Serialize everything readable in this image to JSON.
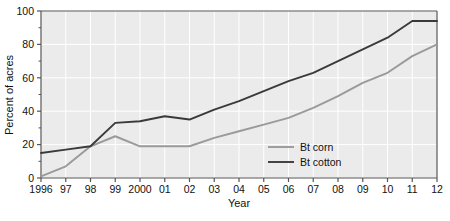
{
  "chart_data": {
    "type": "line",
    "title": "",
    "xlabel": "Year",
    "ylabel": "Percent of acres",
    "x": [
      1996,
      1997,
      1998,
      1999,
      2000,
      2001,
      2002,
      2003,
      2004,
      2005,
      2006,
      2007,
      2008,
      2009,
      2010,
      2011,
      2012
    ],
    "xtick_labels": [
      "1996",
      "97",
      "98",
      "99",
      "2000",
      "01",
      "02",
      "03",
      "04",
      "05",
      "06",
      "07",
      "08",
      "09",
      "10",
      "11",
      "12"
    ],
    "ytick_labels": [
      "0",
      "20",
      "40",
      "60",
      "80",
      "100"
    ],
    "yticks": [
      0,
      20,
      40,
      60,
      80,
      100
    ],
    "ylim": [
      0,
      100
    ],
    "xlim": [
      1996,
      2012
    ],
    "grid": true,
    "legend_position": "inside-lower-right",
    "series": [
      {
        "name": "Bt corn",
        "color": "#9a9a9a",
        "values": [
          1,
          7,
          19,
          25,
          19,
          19,
          19,
          24,
          28,
          32,
          36,
          42,
          49,
          57,
          63,
          73,
          80
        ]
      },
      {
        "name": "Bt cotton",
        "color": "#3a3a3a",
        "values": [
          15,
          17,
          19,
          33,
          34,
          37,
          35,
          41,
          46,
          52,
          58,
          63,
          70,
          77,
          84,
          94,
          94
        ]
      }
    ]
  },
  "axes": {
    "y_label": "Percent of acres",
    "x_label": "Year"
  },
  "legend": {
    "items": [
      {
        "label": "Bt corn",
        "color": "#9a9a9a"
      },
      {
        "label": "Bt cotton",
        "color": "#3a3a3a"
      }
    ]
  },
  "caption": {
    "text": ""
  },
  "colors": {
    "plot_background": "#ebebeb",
    "grid": "#ffffff",
    "axis": "#555555",
    "text": "#111111"
  }
}
